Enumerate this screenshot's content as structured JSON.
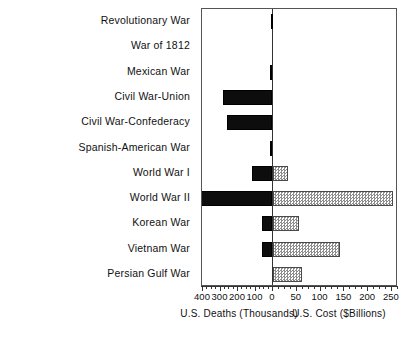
{
  "chart_data": {
    "type": "bar",
    "orientation": "horizontal",
    "subtype": "bidirectional-paired-bar",
    "title": "",
    "categories": [
      "Revolutionary War",
      "War of 1812",
      "Mexican War",
      "Civil War-Union",
      "Civil War-Confederacy",
      "Spanish-American War",
      "World War I",
      "World War II",
      "Korean War",
      "Vietnam War",
      "Persian Gulf War"
    ],
    "series": [
      {
        "name": "U.S. Deaths (Thousands)",
        "direction": "left",
        "fill": "solid-black",
        "axis_label": "U.S. Deaths (Thousands)",
        "axis_ticks": [
          400,
          300,
          200,
          100,
          0
        ],
        "axis_minor_step": 25,
        "axis_range": [
          400,
          0
        ],
        "values": [
          4,
          2,
          13,
          280,
          260,
          11,
          116,
          405,
          55,
          58,
          0
        ]
      },
      {
        "name": "U.S. Cost ($Billions)",
        "direction": "right",
        "fill": "hatched-gray",
        "axis_label": "U.S. Cost ($Billions)",
        "axis_ticks": [
          0,
          50,
          100,
          150,
          200,
          250
        ],
        "axis_minor_step": 12.5,
        "axis_range": [
          0,
          265
        ],
        "values": [
          0,
          0,
          0,
          0,
          0,
          0,
          32,
          253,
          54,
          140,
          61
        ]
      }
    ],
    "xlabel_left": "U.S. Deaths (Thousands)",
    "xlabel_right": "U.S. Cost ($Billions)",
    "ylabel": "",
    "grid": false,
    "legend": "none",
    "colors": {
      "deaths_bar": "#0d0d0d",
      "cost_bar_hatch": "#8d8d8d",
      "axis": "#333333",
      "text": "#111111",
      "background": "#ffffff"
    }
  },
  "axis": {
    "left_tick_labels": [
      "400",
      "300",
      "200",
      "100",
      "0"
    ],
    "right_tick_labels": [
      "50",
      "100",
      "150",
      "200",
      "250"
    ],
    "left_title": "U.S. Deaths (Thousands)",
    "right_title": "U.S. Cost ($Billions)"
  }
}
